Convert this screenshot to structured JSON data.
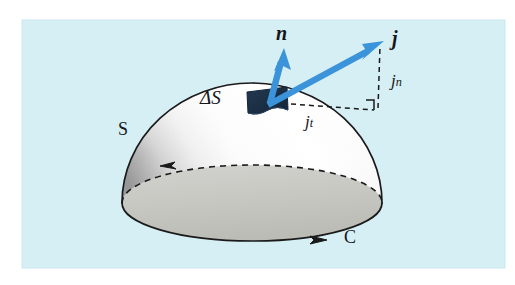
{
  "figure": {
    "background_color": "#ffffff",
    "panel_color": "#d6eff5",
    "labels": {
      "normal_vector": "n",
      "current_density_vector": "j",
      "normal_component": "j",
      "normal_component_subscript": "n",
      "tangential_component": "j",
      "tangential_component_subscript": "t",
      "surface_element": "ΔS",
      "surface": "S",
      "contour": "C"
    },
    "colors": {
      "arrow_blue": "#3b93d9",
      "arrow_blue_dark": "#2579b8",
      "patch_navy": "#1c3048",
      "dome_light": "#fdfdfd",
      "dome_shadow": "#8f8f8f",
      "base_gray": "#c9c9c4",
      "outline": "#1a1a1a",
      "panel": "#d6eff5"
    },
    "geometry": {
      "panel": {
        "x": 22,
        "y": 20,
        "width": 483,
        "height": 248
      },
      "dome_center": {
        "x": 252,
        "y": 203
      },
      "dome_radius_x": 130,
      "dome_radius_y": 120,
      "base_ellipse_ry": 38,
      "patch_center": {
        "x": 270,
        "y": 101
      },
      "n_arrow_tip": {
        "x": 284,
        "y": 50
      },
      "j_arrow_tip": {
        "x": 382,
        "y": 42
      },
      "right_angle_corner": {
        "x": 378,
        "y": 110
      }
    }
  }
}
